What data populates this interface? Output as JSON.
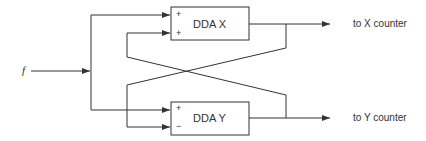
{
  "diagram": {
    "input_label": "f",
    "blocks": [
      {
        "label": "DDA X",
        "inputs": [
          "+",
          "+"
        ],
        "output_label": "to X counter"
      },
      {
        "label": "DDA Y",
        "inputs": [
          "+",
          "−"
        ],
        "output_label": "to Y counter"
      }
    ],
    "line_color": "#333333"
  }
}
